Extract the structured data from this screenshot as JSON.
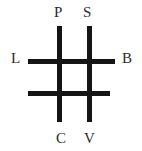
{
  "figure": {
    "type": "grid-diagram",
    "background_color": "#ffffff",
    "line_color": "#151515",
    "label_color": "#2b2b2b",
    "line_thickness_px": 5,
    "labels": {
      "top_left": "P",
      "top_right": "S",
      "left": "L",
      "right": "B",
      "bottom_left": "C",
      "bottom_right": "V"
    },
    "lines": [
      {
        "name": "vertical-left",
        "orientation": "vertical",
        "label_top": "P",
        "label_bottom": "C"
      },
      {
        "name": "vertical-right",
        "orientation": "vertical",
        "label_top": "S",
        "label_bottom": "V"
      },
      {
        "name": "horizontal-top",
        "orientation": "horizontal",
        "label_left": "L",
        "label_right": "B"
      },
      {
        "name": "horizontal-bottom",
        "orientation": "horizontal",
        "label_left": "",
        "label_right": ""
      }
    ]
  }
}
